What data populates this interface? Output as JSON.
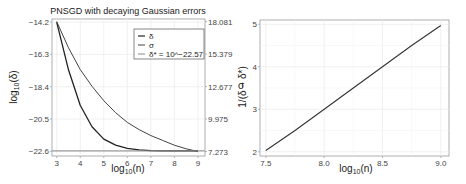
{
  "chart_data": [
    {
      "type": "line",
      "title": "PNSGD with decaying Gaussian errors",
      "xlabel": "log10(n)",
      "ylabel": "log10(δ)",
      "y2label": "σ",
      "x_ticks": [
        "3",
        "4",
        "5",
        "6",
        "7",
        "8",
        "9"
      ],
      "y_ticks": [
        "-14.2",
        "-16.3",
        "-18.4",
        "-20.5",
        "-22.6"
      ],
      "y2_ticks": [
        "18.081",
        "15.379",
        "12.677",
        "9.975",
        "7.273"
      ],
      "xlim": [
        2.8,
        9.3
      ],
      "ylim": [
        -22.9,
        -14.0
      ],
      "y2lim": [
        6.9,
        18.3
      ],
      "grid": true,
      "legend_position": "upper right",
      "series": [
        {
          "name": "δ",
          "axis": "left",
          "x": [
            3.0,
            3.5,
            4.0,
            4.5,
            5.0,
            5.5,
            6.0,
            6.5,
            7.0,
            7.5,
            8.0,
            8.5,
            9.0
          ],
          "values": [
            -14.2,
            -17.3,
            -19.6,
            -21.0,
            -21.8,
            -22.2,
            -22.4,
            -22.5,
            -22.55,
            -22.56,
            -22.57,
            -22.57,
            -22.57
          ]
        },
        {
          "name": "σ",
          "axis": "right",
          "x": [
            3.0,
            3.5,
            4.0,
            4.5,
            5.0,
            5.5,
            6.0,
            6.5,
            7.0,
            7.5,
            8.0,
            8.5,
            9.0
          ],
          "values": [
            18.081,
            15.9,
            14.1,
            12.7,
            11.5,
            10.5,
            9.7,
            9.1,
            8.6,
            8.2,
            7.8,
            7.5,
            7.273
          ]
        },
        {
          "name": "δ* = 10^−22.57",
          "axis": "left",
          "x": [
            2.8,
            9.3
          ],
          "values": [
            -22.57,
            -22.57
          ]
        }
      ]
    },
    {
      "type": "line",
      "title": "",
      "xlabel": "log10(n)",
      "ylabel": "1/(δ − δ*)",
      "x_ticks": [
        "7.5",
        "8.0",
        "8.5",
        "9.0"
      ],
      "y_ticks": [
        "2",
        "3",
        "4",
        "5"
      ],
      "xlim": [
        7.45,
        9.07
      ],
      "ylim": [
        1.9,
        5.1
      ],
      "grid": true,
      "series": [
        {
          "name": "1/(δ − δ*)",
          "x": [
            7.5,
            7.75,
            8.0,
            8.25,
            8.5,
            8.75,
            9.0
          ],
          "values": [
            2.03,
            2.5,
            3.0,
            3.5,
            4.0,
            4.5,
            4.97
          ]
        }
      ]
    }
  ],
  "left": {
    "title": "PNSGD with decaying Gaussian errors",
    "xlabel_main": "log",
    "xlabel_sub": "10",
    "xlabel_tail": "(n)",
    "ylabel_main": "log",
    "ylabel_sub": "10",
    "ylabel_tail": "(δ)",
    "y2label": "σ",
    "legend": [
      "δ",
      "σ",
      "δ* = 10^−22.57"
    ]
  },
  "right": {
    "xlabel_main": "log",
    "xlabel_sub": "10",
    "xlabel_tail": "(n)",
    "ylabel": "1/(δ − δ*)"
  }
}
